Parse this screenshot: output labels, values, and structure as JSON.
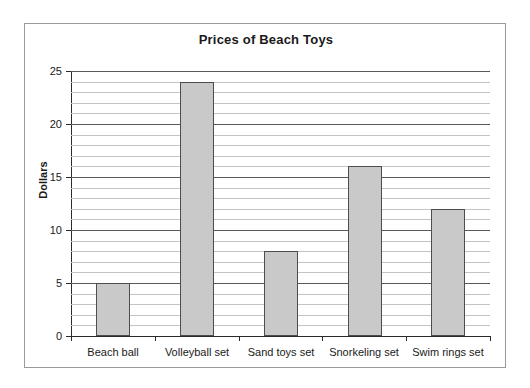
{
  "chart_data": {
    "type": "bar",
    "title": "Prices of Beach Toys",
    "xlabel": "",
    "ylabel": "Dollars",
    "categories": [
      "Beach ball",
      "Volleyball set",
      "Sand toys set",
      "Snorkeling set",
      "Swim rings set"
    ],
    "values": [
      5,
      24,
      8,
      16,
      12
    ],
    "ylim": [
      0,
      25
    ],
    "ytick_labels": [
      "0",
      "5",
      "10",
      "15",
      "20",
      "25"
    ],
    "ytick_values": [
      0,
      5,
      10,
      15,
      20,
      25
    ],
    "minor_tick_interval": 1,
    "major_tick_interval": 5,
    "grid": "horizontal",
    "legend": "none",
    "bar_fill_color": "#c9c9c9",
    "bar_border_color": "#4d4d4d",
    "major_gridline_color": "#5a5a5a",
    "minor_gridline_color": "#c4c4c4",
    "axis_color": "#2b2b2b",
    "frame_border_color": "#9a9a9a",
    "background_color": "#ffffff",
    "text_color": "#1a1a1a"
  }
}
